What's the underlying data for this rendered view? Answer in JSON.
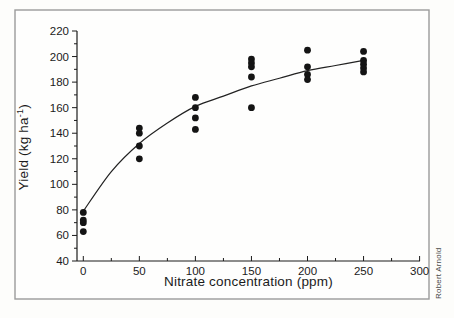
{
  "figure": {
    "credit": "Robert Arnold"
  },
  "chart_data": {
    "type": "scatter",
    "title": "",
    "xlabel": "Nitrate concentration (ppm)",
    "ylabel": "Yield (kg ha⁻¹)",
    "ylabel_parts": {
      "prefix": "Yield (kg ha",
      "sup": "-1",
      "suffix": ")"
    },
    "xlim": [
      0,
      300
    ],
    "ylim": [
      40,
      220
    ],
    "x_ticks": [
      0,
      50,
      100,
      150,
      200,
      250,
      300
    ],
    "x_minor_step": 25,
    "y_ticks": [
      40,
      60,
      80,
      100,
      120,
      140,
      160,
      180,
      200,
      220
    ],
    "y_minor_step": 10,
    "grid": false,
    "legend": "none",
    "point_color": "#141414",
    "curve_color": "#222222",
    "points": [
      {
        "x": 0,
        "y": 78
      },
      {
        "x": 0,
        "y": 72
      },
      {
        "x": 0,
        "y": 70
      },
      {
        "x": 0,
        "y": 63
      },
      {
        "x": 50,
        "y": 144
      },
      {
        "x": 50,
        "y": 140
      },
      {
        "x": 50,
        "y": 130
      },
      {
        "x": 50,
        "y": 120
      },
      {
        "x": 100,
        "y": 168
      },
      {
        "x": 100,
        "y": 160
      },
      {
        "x": 100,
        "y": 152
      },
      {
        "x": 100,
        "y": 143
      },
      {
        "x": 150,
        "y": 198
      },
      {
        "x": 150,
        "y": 195
      },
      {
        "x": 150,
        "y": 192
      },
      {
        "x": 150,
        "y": 184
      },
      {
        "x": 150,
        "y": 160
      },
      {
        "x": 200,
        "y": 205
      },
      {
        "x": 200,
        "y": 192
      },
      {
        "x": 200,
        "y": 186
      },
      {
        "x": 200,
        "y": 182
      },
      {
        "x": 250,
        "y": 204
      },
      {
        "x": 250,
        "y": 197
      },
      {
        "x": 250,
        "y": 194
      },
      {
        "x": 250,
        "y": 191
      },
      {
        "x": 250,
        "y": 188
      }
    ],
    "curve": {
      "description": "saturating best-fit curve",
      "x": [
        0,
        25,
        50,
        75,
        100,
        125,
        150,
        175,
        200,
        225,
        250
      ],
      "y": [
        79,
        110,
        132,
        148,
        161,
        169,
        177,
        183,
        189,
        193,
        197
      ]
    }
  }
}
